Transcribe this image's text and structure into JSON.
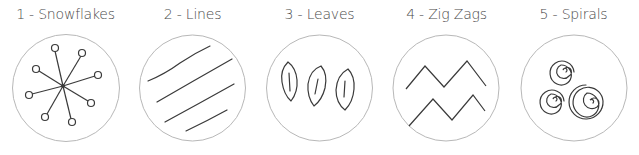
{
  "colors": {
    "background": "#ffffff",
    "circle_stroke": "#b8b8b8",
    "drawing_stroke": "#3a3a3a",
    "title_text": "#4a4a4a"
  },
  "patterns": [
    {
      "number": 1,
      "title": "1 - Snowflakes",
      "name": "Snowflakes",
      "icon": "snowflake-icon"
    },
    {
      "number": 2,
      "title": "2 - Lines",
      "name": "Lines",
      "icon": "diagonal-lines-icon"
    },
    {
      "number": 3,
      "title": "3 - Leaves",
      "name": "Leaves",
      "icon": "leaves-icon"
    },
    {
      "number": 4,
      "title": "4 - Zig Zags",
      "name": "Zig Zags",
      "icon": "zigzag-icon"
    },
    {
      "number": 5,
      "title": "5 - Spirals",
      "name": "Spirals",
      "icon": "spirals-icon"
    }
  ]
}
